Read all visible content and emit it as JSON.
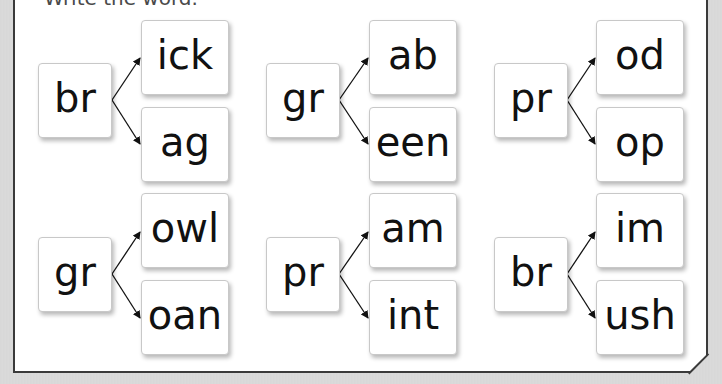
{
  "worksheet": {
    "instruction": "Write the word.",
    "groups": [
      {
        "onset": "br",
        "rimes": [
          "ick",
          "ag"
        ]
      },
      {
        "onset": "gr",
        "rimes": [
          "ab",
          "een"
        ]
      },
      {
        "onset": "pr",
        "rimes": [
          "od",
          "op"
        ]
      },
      {
        "onset": "gr",
        "rimes": [
          "owl",
          "oan"
        ]
      },
      {
        "onset": "pr",
        "rimes": [
          "am",
          "int"
        ]
      },
      {
        "onset": "br",
        "rimes": [
          "im",
          "ush"
        ]
      }
    ]
  },
  "colors": {
    "background": "#d9d9d9",
    "sheet": "#ffffff",
    "border": "#3a3a3a",
    "text": "#111111"
  }
}
